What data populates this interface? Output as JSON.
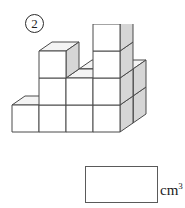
{
  "problem": {
    "number": "2",
    "number_style": "circled"
  },
  "answer": {
    "value": "",
    "placeholder": "",
    "unit_base": "cm",
    "unit_exponent": "3",
    "unit_full": "cm3"
  },
  "figure": {
    "type": "isometric-cube-stack",
    "cube_count": 15,
    "palette": {
      "top_face": "#f4f4f4",
      "front_face": "#ffffff",
      "side_face": "#d6d6d6",
      "outline": "#4a4a4a",
      "inner_line": "#7a7a7a"
    },
    "cube_size": {
      "width": 27,
      "height": 27,
      "depth_x": 13,
      "depth_y": -9
    },
    "origin": {
      "x": 12,
      "y": 108
    },
    "cubes": [
      {
        "col": 0,
        "row": 0,
        "level": 0
      },
      {
        "col": 1,
        "row": 0,
        "level": 0
      },
      {
        "col": 2,
        "row": 0,
        "level": 0
      },
      {
        "col": 3,
        "row": 0,
        "level": 0
      },
      {
        "col": 1,
        "row": 1,
        "level": 0
      },
      {
        "col": 2,
        "row": 1,
        "level": 0
      },
      {
        "col": 3,
        "row": 1,
        "level": 0
      },
      {
        "col": 2,
        "row": 1,
        "level": 1
      },
      {
        "col": 3,
        "row": 1,
        "level": 1
      },
      {
        "col": 2,
        "row": 0,
        "level": 1
      },
      {
        "col": 3,
        "row": 0,
        "level": 1
      },
      {
        "col": 1,
        "row": 0,
        "level": 1
      },
      {
        "col": 1,
        "row": 0,
        "level": 2
      },
      {
        "col": 3,
        "row": 0,
        "level": 2
      },
      {
        "col": 3,
        "row": 0,
        "level": 3
      }
    ]
  }
}
